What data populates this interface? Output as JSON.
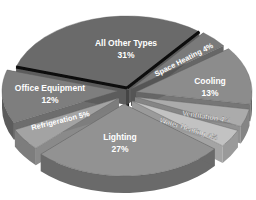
{
  "chart_data": {
    "type": "pie",
    "style": "3d-exploded",
    "title": "",
    "categories": [
      "All Other Types",
      "Space Heating",
      "Cooling",
      "Ventilation",
      "Water Heating",
      "Lighting",
      "Refrigeration",
      "Office Equipment"
    ],
    "values": [
      31,
      4,
      13,
      4,
      4,
      27,
      5,
      12
    ],
    "unit": "%",
    "slices": [
      {
        "label": "All Other Types",
        "value": 31,
        "pct_label": "31%",
        "color": "#6b6b6b",
        "side": "#4a4a4a"
      },
      {
        "label": "Space Heating",
        "value": 4,
        "pct_label": "4%",
        "color": "#7a7a7a",
        "side": "#555555"
      },
      {
        "label": "Cooling",
        "value": 13,
        "pct_label": "13%",
        "color": "#8c8c8c",
        "side": "#666666"
      },
      {
        "label": "Ventilation",
        "value": 4,
        "pct_label": "4%",
        "color": "#ababab",
        "side": "#858585"
      },
      {
        "label": "Water Heating",
        "value": 4,
        "pct_label": "4%",
        "color": "#c2c2c2",
        "side": "#9a9a9a"
      },
      {
        "label": "Lighting",
        "value": 27,
        "pct_label": "27%",
        "color": "#929292",
        "side": "#6a6a6a"
      },
      {
        "label": "Refrigeration",
        "value": 5,
        "pct_label": "5%",
        "color": "#a3a3a3",
        "side": "#7d7d7d"
      },
      {
        "label": "Office Equipment",
        "value": 12,
        "pct_label": "12%",
        "color": "#7e7e7e",
        "side": "#5c5c5c"
      }
    ],
    "legend": "none (labels on slices)"
  },
  "labels": {
    "all_other": {
      "name": "All Other Types",
      "pct": "31%"
    },
    "space_heating": "Space Heating 4%",
    "cooling": {
      "name": "Cooling",
      "pct": "13%"
    },
    "ventilation": "Ventilation 4%",
    "water_heating": "Water Heating 4%",
    "lighting": {
      "name": "Lighting",
      "pct": "27%"
    },
    "refrigeration": "Refrigeration 5%",
    "office_equipment": {
      "name": "Office Equipment",
      "pct": "12%"
    }
  }
}
